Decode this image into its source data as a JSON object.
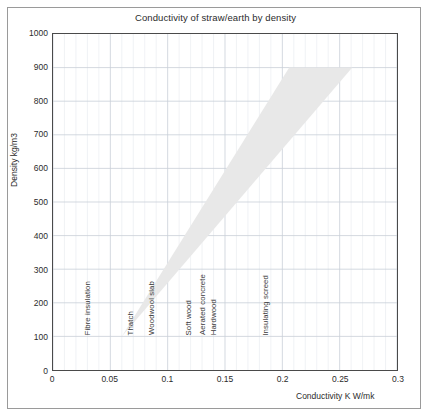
{
  "chart_data": {
    "type": "area",
    "title": "Conductivity of straw/earth by density",
    "xlabel": "Conductivity K W/mk",
    "ylabel": "Density kg/m3",
    "xlim": [
      0,
      0.3
    ],
    "ylim": [
      0,
      1000
    ],
    "xticks": [
      "0",
      "0.05",
      "0.1",
      "0.15",
      "0.2",
      "0.25",
      "0.3"
    ],
    "xtick_values": [
      0,
      0.05,
      0.1,
      0.15,
      0.2,
      0.25,
      0.3
    ],
    "yticks": [
      "0",
      "100",
      "200",
      "300",
      "400",
      "500",
      "600",
      "700",
      "800",
      "900",
      "1000"
    ],
    "ytick_values": [
      0,
      100,
      200,
      300,
      400,
      500,
      600,
      700,
      800,
      900,
      1000
    ],
    "grid": true,
    "minor_grid_x_step": 0.01,
    "legend": "none",
    "series": [
      {
        "name": "straw/earth conductivity band",
        "type": "polygon",
        "fill_color": "#e8e8e8",
        "points": [
          {
            "x": 0.06,
            "y": 100
          },
          {
            "x": 0.206,
            "y": 900
          },
          {
            "x": 0.261,
            "y": 900
          },
          {
            "x": 0.06,
            "y": 100
          }
        ],
        "upper_edge": [
          {
            "x": 0.06,
            "y": 100
          },
          {
            "x": 0.206,
            "y": 900
          }
        ],
        "lower_edge": [
          {
            "x": 0.06,
            "y": 100
          },
          {
            "x": 0.261,
            "y": 900
          }
        ],
        "flat_top": {
          "y": 900,
          "x_from": 0.206,
          "x_to": 0.261
        }
      }
    ],
    "annotations": [
      {
        "label": "Fibre insulation",
        "x": 0.031,
        "y_base": 100
      },
      {
        "label": "Thatch",
        "x": 0.0685,
        "y_base": 100
      },
      {
        "label": "Woodwool slab",
        "x": 0.087,
        "y_base": 100
      },
      {
        "label": "Soft wood",
        "x": 0.1185,
        "y_base": 100
      },
      {
        "label": "Aerated concrete",
        "x": 0.1305,
        "y_base": 100
      },
      {
        "label": "Hardwood",
        "x": 0.1405,
        "y_base": 100
      },
      {
        "label": "Insulating screed",
        "x": 0.1855,
        "y_base": 100
      }
    ]
  },
  "colors": {
    "band_fill": "#e8e8e8",
    "grid_major": "#c9cfd8",
    "grid_minor": "#e6e9ee",
    "axis": "#4a4a4a",
    "frame": "#9a9a9a",
    "text": "#2b2b2b"
  }
}
